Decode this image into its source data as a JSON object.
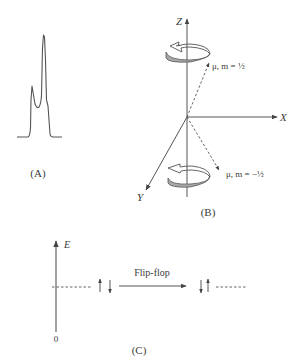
{
  "panels": {
    "a": {
      "label": "(A)",
      "description": "NMR spectrum with two peaks: smaller left peak and taller right peak"
    },
    "b": {
      "label": "(B)",
      "axes": {
        "z": "Z",
        "x": "X",
        "y": "Y"
      },
      "upper_state": {
        "symbol": "μ",
        "text": "μ, m = ½"
      },
      "lower_state": {
        "symbol": "μ",
        "text": "μ, m = −½"
      }
    },
    "c": {
      "label": "(C)",
      "axis_label": "E",
      "origin_label": "0",
      "transition_label": "Flip-flop",
      "left_spins": [
        "up",
        "down"
      ],
      "right_spins": [
        "down",
        "up"
      ]
    }
  },
  "colors": {
    "line": "#555555",
    "band_fill": "#a8a8a8",
    "text": "#3a3a3a"
  }
}
